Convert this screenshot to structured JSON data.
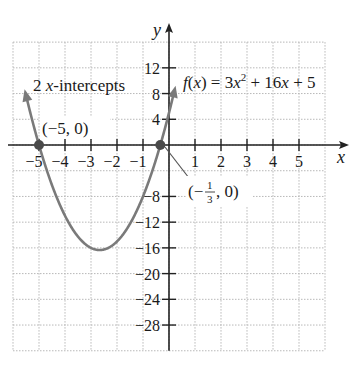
{
  "chart_data": {
    "type": "line",
    "title": "",
    "function_label": "f(x) = 3x^2 + 16x + 5",
    "function": {
      "a": 3,
      "b": 16,
      "c": 5
    },
    "xlabel": "x",
    "ylabel": "y",
    "xlim": [
      -6,
      6
    ],
    "ylim": [
      -32,
      16
    ],
    "grid": true,
    "x_ticks": [
      -5,
      -4,
      -3,
      -2,
      -1,
      1,
      2,
      3,
      4,
      5
    ],
    "x_tick_labels": [
      "−5",
      "−4",
      "−3",
      "−2",
      "−1",
      "1",
      "2",
      "3",
      "4",
      "5"
    ],
    "y_ticks": [
      12,
      8,
      4,
      -8,
      -12,
      -16,
      -20,
      -24,
      -28
    ],
    "y_tick_labels": [
      "12",
      "8",
      "4",
      "−8",
      "−12",
      "−16",
      "−20",
      "−24",
      "−28"
    ],
    "x_intercepts": [
      {
        "x": -5,
        "y": 0,
        "label": "(−5, 0)"
      },
      {
        "x": -0.3333,
        "y": 0,
        "label": "(−1/3, 0)"
      }
    ],
    "vertex": {
      "x": -2.667,
      "y": -16.333
    },
    "series": [
      {
        "name": "f(x) = 3x^2 + 16x + 5",
        "x": [
          -5.55,
          -5,
          -4.5,
          -4,
          -3.5,
          -3,
          -2.667,
          -2,
          -1.5,
          -1,
          -0.5,
          -0.333,
          0,
          0.27
        ],
        "y": [
          8.6,
          0,
          -6.25,
          -11,
          -14.25,
          -16,
          -16.33,
          -15,
          -12.25,
          -8,
          -2.25,
          0,
          5,
          9.5
        ]
      }
    ],
    "annotations": [
      {
        "text": "2 x-intercepts"
      },
      {
        "text": "f(x) = 3x² + 16x + 5"
      }
    ]
  },
  "text": {
    "y_axis_label": "y",
    "x_axis_label": "x",
    "intercepts_note_num": "2 ",
    "intercepts_note_var": "x",
    "intercepts_note_rest": "-intercepts",
    "point1_label": "(−5, 0)",
    "point2_open": "(−",
    "point2_num": "1",
    "point2_den": "3",
    "point2_close": ", 0)",
    "fn_f": "f",
    "fn_open": "(",
    "fn_x": "x",
    "fn_mid": ") = 3",
    "fn_x2": "x",
    "fn_sup": "2",
    "fn_plus": " + 16",
    "fn_x3": "x",
    "fn_tail": " + 5"
  },
  "colors": {
    "curve": "#7a7a7a",
    "axis": "#222222",
    "grid": "#b8b8b8",
    "point": "#4a4a4a"
  }
}
